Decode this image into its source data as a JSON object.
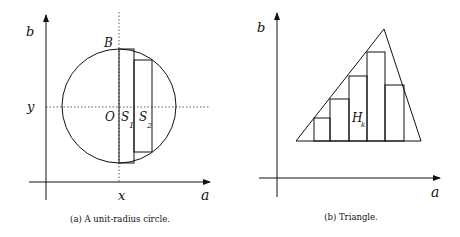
{
  "panel_a": {
    "caption": "(a) A unit-radius circle.",
    "axis_x_label": "a",
    "axis_y_label": "b",
    "coord_x_label": "x",
    "coord_y_label": "y",
    "point_top_label": "B",
    "center_label": "O",
    "strip1_label": "S",
    "strip1_sub": "1",
    "strip2_label": "S",
    "strip2_sub": "2"
  },
  "panel_b": {
    "caption": "(b) Triangle.",
    "axis_x_label": "a",
    "axis_y_label": "b",
    "rect_label": "H",
    "rect_sub": "k"
  }
}
